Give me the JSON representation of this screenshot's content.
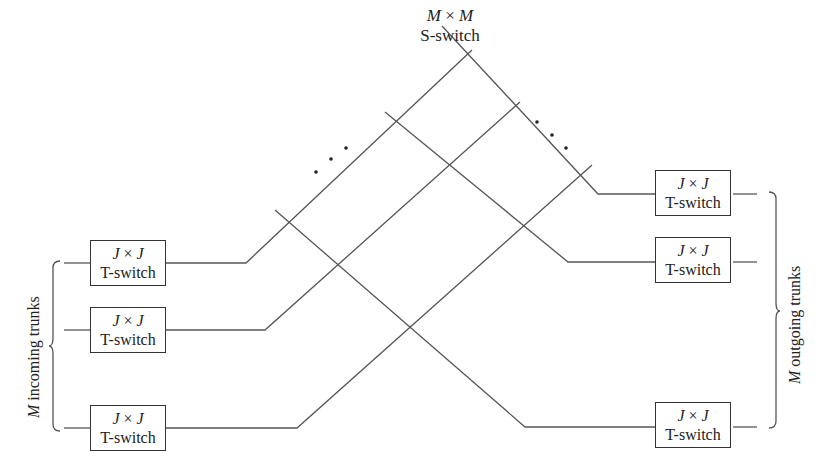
{
  "s_switch": {
    "dimension": "M × M",
    "dim_left": "M",
    "times": "×",
    "dim_right": "M",
    "label": "S-switch"
  },
  "incoming": {
    "label_var": "M",
    "label_text": " incoming trunks",
    "boxes": [
      {
        "dim_left": "J",
        "times": "×",
        "dim_right": "J",
        "label": "T-switch"
      },
      {
        "dim_left": "J",
        "times": "×",
        "dim_right": "J",
        "label": "T-switch"
      },
      {
        "dim_left": "J",
        "times": "×",
        "dim_right": "J",
        "label": "T-switch"
      }
    ]
  },
  "outgoing": {
    "label_var": "M",
    "label_text": " outgoing trunks",
    "boxes": [
      {
        "dim_left": "J",
        "times": "×",
        "dim_right": "J",
        "label": "T-switch"
      },
      {
        "dim_left": "J",
        "times": "×",
        "dim_right": "J",
        "label": "T-switch"
      },
      {
        "dim_left": "J",
        "times": "×",
        "dim_right": "J",
        "label": "T-switch"
      }
    ]
  },
  "ellipsis": [
    "•",
    "•",
    "•"
  ],
  "colors": {
    "line": "#555555",
    "box_border": "#333333",
    "text": "#222222"
  }
}
